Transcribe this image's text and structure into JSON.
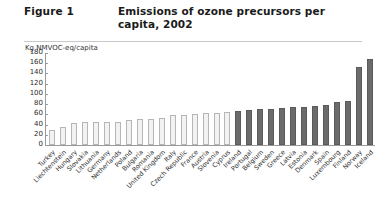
{
  "header": {
    "figure_label": "Figure 1",
    "title": "Emissions of ozone precursors per capita, 2002"
  },
  "unit_caption": "Kg NMVOC-eq/capita",
  "chart_data": {
    "type": "bar",
    "title": "Emissions of ozone precursors per capita, 2002",
    "xlabel": "",
    "ylabel": "Kg NMVOC-eq/capita",
    "ylim": [
      0,
      180
    ],
    "yticks": [
      0,
      20,
      40,
      60,
      80,
      100,
      120,
      140,
      160,
      180
    ],
    "grid": false,
    "legend": "none",
    "colors": {
      "light_bar_fill": "#f2f2f2",
      "light_bar_border": "#b6b6b6",
      "dark_bar_fill": "#6b6b6b",
      "dark_bar_border": "#5a5a5a",
      "axis": "#9a9a9a",
      "text": "#2f2f2f"
    },
    "categories": [
      "Turkey",
      "Liechtenstein",
      "Hungary",
      "Slovakia",
      "Lithuania",
      "Germany",
      "Netherlands",
      "Poland",
      "Bulgaria",
      "Romania",
      "United Kingdom",
      "Italy",
      "Czech Republic",
      "France",
      "Austria",
      "Slovenia",
      "Cyprus",
      "Ireland",
      "Portugal",
      "Belgium",
      "Sweden",
      "Greece",
      "Latvia",
      "Estonia",
      "Denmark",
      "Spain",
      "Luxembourg",
      "Finland",
      "Norway",
      "Iceland"
    ],
    "values": [
      30,
      35,
      43,
      45,
      45,
      45,
      46,
      48,
      50,
      50,
      53,
      58,
      58,
      60,
      62,
      63,
      64,
      66,
      68,
      70,
      70,
      72,
      74,
      74,
      76,
      78,
      84,
      86,
      152,
      168
    ],
    "series_groups": [
      {
        "name": "light",
        "start_index": 0,
        "end_index": 16
      },
      {
        "name": "dark",
        "start_index": 17,
        "end_index": 29
      }
    ]
  }
}
